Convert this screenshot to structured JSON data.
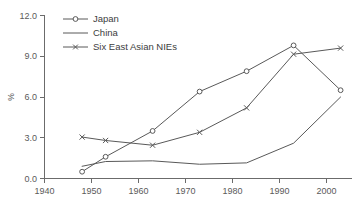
{
  "chart_data": {
    "type": "line",
    "title": "",
    "subtitle": "",
    "xlabel": "",
    "ylabel": "%",
    "xlim": [
      1940,
      2006
    ],
    "ylim": [
      0.0,
      12.0
    ],
    "grid": false,
    "legend_position": "top-left",
    "x": [
      1948,
      1953,
      1963,
      1973,
      1983,
      1993,
      2003
    ],
    "xticks": [
      "1940",
      "1950",
      "1960",
      "1970",
      "1980",
      "1990",
      "2000"
    ],
    "xtick_values": [
      1940,
      1950,
      1960,
      1970,
      1980,
      1990,
      2000
    ],
    "yticks": [
      "0.0",
      "3.0",
      "6.0",
      "9.0",
      "12.0"
    ],
    "ytick_values": [
      0.0,
      3.0,
      6.0,
      9.0,
      12.0
    ],
    "series": [
      {
        "name": "Japan",
        "marker": "circle",
        "x": [
          1948,
          1953,
          1963,
          1973,
          1983,
          1993,
          2003
        ],
        "values": [
          0.5,
          1.6,
          3.5,
          6.4,
          7.9,
          9.8,
          6.5
        ]
      },
      {
        "name": "China",
        "marker": "none",
        "x": [
          1948,
          1953,
          1963,
          1973,
          1983,
          1993,
          2003
        ],
        "values": [
          0.9,
          1.25,
          1.3,
          1.05,
          1.15,
          2.6,
          6.0
        ]
      },
      {
        "name": "Six East Asian NIEs",
        "marker": "cross",
        "x": [
          1948,
          1953,
          1963,
          1973,
          1983,
          1993,
          2003
        ],
        "values": [
          3.05,
          2.8,
          2.45,
          3.4,
          5.2,
          9.15,
          9.6
        ]
      }
    ],
    "colors": {
      "line": "#595959",
      "axis": "#6b6b6b",
      "text": "#4a4a4a",
      "background": "#ffffff"
    }
  },
  "legend": {
    "items": [
      {
        "label": "Japan"
      },
      {
        "label": "China"
      },
      {
        "label": "Six East Asian NIEs"
      }
    ]
  },
  "axes": {
    "y_title": "%"
  }
}
